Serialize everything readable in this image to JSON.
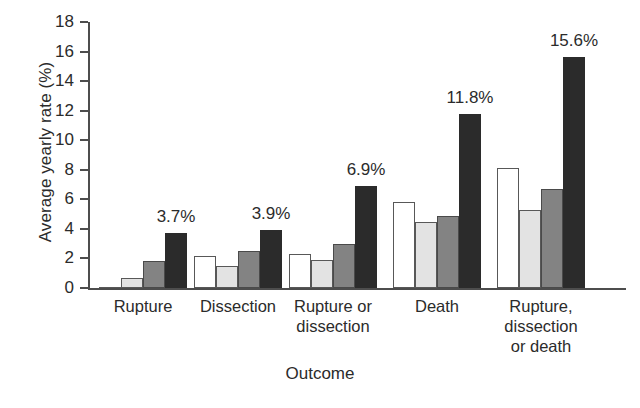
{
  "chart_data": {
    "type": "bar",
    "title": "",
    "xlabel": "Outcome",
    "ylabel": "Average yearly rate (%)",
    "ylim": [
      0,
      18
    ],
    "yticks": [
      0,
      2,
      4,
      6,
      8,
      10,
      12,
      14,
      16,
      18
    ],
    "ytick_labels": [
      "0",
      "2",
      "4",
      "6",
      "8",
      "10",
      "12",
      "14",
      "16",
      "18"
    ],
    "grid": false,
    "legend": "none",
    "categories": [
      "Rupture",
      "Dissection",
      "Rupture or dissection",
      "Death",
      "Rupture, dissection or death"
    ],
    "category_lines": [
      [
        "Rupture"
      ],
      [
        "Dissection"
      ],
      [
        "Rupture or",
        "dissection"
      ],
      [
        "Death"
      ],
      [
        "Rupture,",
        "dissection",
        "or death"
      ]
    ],
    "series": [
      {
        "name": "series-1",
        "color": "#ffffff",
        "values": [
          0.0,
          2.2,
          2.3,
          5.8,
          8.1
        ]
      },
      {
        "name": "series-2",
        "color": "#e3e3e3",
        "values": [
          0.7,
          1.5,
          1.9,
          4.5,
          5.3
        ]
      },
      {
        "name": "series-3",
        "color": "#838383",
        "values": [
          1.8,
          2.5,
          3.0,
          4.9,
          6.7
        ]
      },
      {
        "name": "series-4",
        "color": "#2b2b2b",
        "values": [
          3.7,
          3.9,
          6.9,
          11.8,
          15.6
        ]
      }
    ],
    "annotations": [
      "3.7%",
      "3.9%",
      "6.9%",
      "11.8%",
      "15.6%"
    ]
  }
}
